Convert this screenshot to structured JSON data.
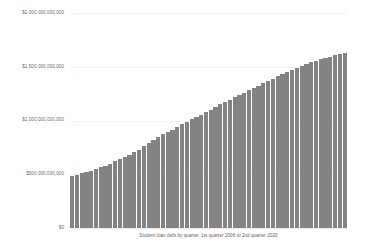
{
  "chart_data": {
    "type": "bar",
    "title": "",
    "caption": "Student loan debt by quarter, 1st quarter 2006 to 2nd quarter 2020",
    "xlabel": "",
    "ylabel": "",
    "ylim": [
      0,
      2000000000000
    ],
    "grid": true,
    "legend": null,
    "bar_color": "#838383",
    "y_ticks": [
      {
        "value": 2000000000000,
        "label": "$2,000,000,000,000"
      },
      {
        "value": 1500000000000,
        "label": "$1,500,000,000,000"
      },
      {
        "value": 1000000000000,
        "label": "$1,000,000,000,000"
      },
      {
        "value": 500000000000,
        "label": "$500,000,000,000"
      },
      {
        "value": 0,
        "label": "$0"
      }
    ],
    "categories": [
      "2006 Q1",
      "2006 Q2",
      "2006 Q3",
      "2006 Q4",
      "2007 Q1",
      "2007 Q2",
      "2007 Q3",
      "2007 Q4",
      "2008 Q1",
      "2008 Q2",
      "2008 Q3",
      "2008 Q4",
      "2009 Q1",
      "2009 Q2",
      "2009 Q3",
      "2009 Q4",
      "2010 Q1",
      "2010 Q2",
      "2010 Q3",
      "2010 Q4",
      "2011 Q1",
      "2011 Q2",
      "2011 Q3",
      "2011 Q4",
      "2012 Q1",
      "2012 Q2",
      "2012 Q3",
      "2012 Q4",
      "2013 Q1",
      "2013 Q2",
      "2013 Q3",
      "2013 Q4",
      "2014 Q1",
      "2014 Q2",
      "2014 Q3",
      "2014 Q4",
      "2015 Q1",
      "2015 Q2",
      "2015 Q3",
      "2015 Q4",
      "2016 Q1",
      "2016 Q2",
      "2016 Q3",
      "2016 Q4",
      "2017 Q1",
      "2017 Q2",
      "2017 Q3",
      "2017 Q4",
      "2018 Q1",
      "2018 Q2",
      "2018 Q3",
      "2018 Q4",
      "2019 Q1",
      "2019 Q2",
      "2019 Q3",
      "2019 Q4",
      "2020 Q1",
      "2020 Q2"
    ],
    "values": [
      480000000000,
      497000000000,
      510000000000,
      520000000000,
      535000000000,
      550000000000,
      565000000000,
      580000000000,
      600000000000,
      620000000000,
      640000000000,
      660000000000,
      680000000000,
      705000000000,
      730000000000,
      760000000000,
      790000000000,
      815000000000,
      845000000000,
      870000000000,
      895000000000,
      915000000000,
      940000000000,
      965000000000,
      990000000000,
      1010000000000,
      1030000000000,
      1055000000000,
      1080000000000,
      1100000000000,
      1125000000000,
      1150000000000,
      1175000000000,
      1195000000000,
      1215000000000,
      1240000000000,
      1260000000000,
      1280000000000,
      1300000000000,
      1320000000000,
      1345000000000,
      1365000000000,
      1385000000000,
      1410000000000,
      1435000000000,
      1450000000000,
      1470000000000,
      1490000000000,
      1510000000000,
      1525000000000,
      1540000000000,
      1555000000000,
      1570000000000,
      1580000000000,
      1595000000000,
      1605000000000,
      1615000000000,
      1625000000000
    ]
  }
}
